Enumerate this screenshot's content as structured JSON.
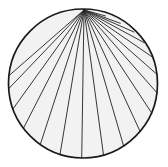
{
  "figure": {
    "title": "Fan of chords from a point on a circle",
    "type": "geometric-diagram",
    "canvas": {
      "width": 168,
      "height": 167,
      "background": "#ffffff"
    },
    "colors": {
      "outline": "#1a1a1a",
      "fill": "#f2f2f2",
      "chord": "#2b2b2b"
    },
    "circle": {
      "label": "circle-outline",
      "cx": 83,
      "cy": 83.5,
      "r": 74.5,
      "stroke_width": 1.7
    },
    "apex": {
      "label": "apex-vertex",
      "x": 84,
      "y": 10,
      "description": "common point on circle where all chords meet"
    },
    "chord_stroke_width": 0.95,
    "chords": [
      {
        "name": "chord-1",
        "angle_deg": 186,
        "x2": 8.9,
        "y2": 75.7
      },
      {
        "name": "chord-2",
        "angle_deg": 176,
        "x2": 8.7,
        "y2": 88.7
      },
      {
        "name": "chord-3",
        "angle_deg": 160,
        "x2": 13.0,
        "y2": 108.9
      },
      {
        "name": "chord-4",
        "angle_deg": 143,
        "x2": 23.5,
        "y2": 128.2
      },
      {
        "name": "chord-5",
        "angle_deg": 125,
        "x2": 40.3,
        "y2": 144.5
      },
      {
        "name": "chord-6",
        "angle_deg": 108,
        "x2": 60.0,
        "y2": 154.6
      },
      {
        "name": "chord-7",
        "angle_deg": 91,
        "x2": 81.7,
        "y2": 158.0
      },
      {
        "name": "chord-8",
        "angle_deg": 74,
        "x2": 103.5,
        "y2": 155.1
      },
      {
        "name": "chord-9",
        "angle_deg": 57,
        "x2": 123.6,
        "y2": 145.9
      },
      {
        "name": "chord-10",
        "angle_deg": 40,
        "x2": 140.1,
        "y2": 131.4
      },
      {
        "name": "chord-11",
        "angle_deg": 24,
        "x2": 151.8,
        "y2": 113.2
      },
      {
        "name": "chord-12",
        "angle_deg": 8,
        "x2": 157.2,
        "y2": 93.1
      },
      {
        "name": "chord-13",
        "angle_deg": 353,
        "x2": 157.0,
        "y2": 74.4
      },
      {
        "name": "chord-14",
        "angle_deg": 339,
        "x2": 152.0,
        "y2": 56.8
      },
      {
        "name": "chord-15",
        "angle_deg": 326,
        "x2": 144.2,
        "y2": 42.7
      },
      {
        "name": "chord-16",
        "angle_deg": 313,
        "x2": 133.9,
        "y2": 32.0
      },
      {
        "name": "chord-17",
        "angle_deg": 300,
        "x2": 120.3,
        "y2": 23.3
      },
      {
        "name": "chord-18",
        "angle_deg": 287,
        "x2": 105.6,
        "y2": 16.0
      }
    ]
  }
}
